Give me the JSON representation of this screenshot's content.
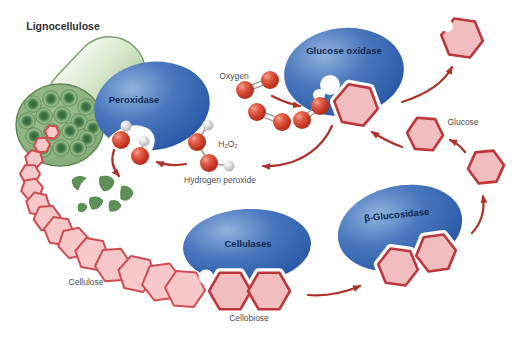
{
  "figure": {
    "labels": {
      "lignocellulose": "Lignocellulose",
      "peroxidase": "Peroxidase",
      "glucose_oxidase": "Glucose oxidase",
      "oxygen": "Oxygen",
      "h2o2": "H₂O₂",
      "hydrogen_peroxide": "Hydrogen peroxide",
      "glucose": "Glucose",
      "beta_glucosidase": "β-Glucosidase",
      "cellulases": "Cellulases",
      "cellulose": "Cellulose",
      "cellobiose": "Cellobiose"
    },
    "colors": {
      "enzyme_blue": "#2a5aa9",
      "enzyme_text": "#122b52",
      "hexagon_fill": "#f4c1c2",
      "hexagon_stroke": "#bf3a40",
      "arrow_red": "#ad3227",
      "oxygen_atom_red": "#cf3a26",
      "hydrogen_atom_grey": "#c9c9c9",
      "lignin_green": "#5f9057",
      "log_green": "#cde0bf",
      "label_grey": "#4d4d4d",
      "background": "#ffffff"
    },
    "icons": {
      "enzyme": "blue-blob",
      "sugar_unit": "pink-hexagon",
      "oxygen_atom": "red-sphere",
      "hydrogen_atom": "grey-sphere",
      "lignin_fragment": "green-chip",
      "wood_fiber": "green-log"
    }
  }
}
